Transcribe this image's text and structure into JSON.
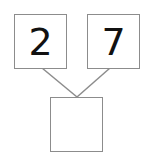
{
  "diagram": {
    "type": "number-bond",
    "parts": [
      {
        "id": "left",
        "value": "2"
      },
      {
        "id": "right",
        "value": "7"
      }
    ],
    "whole": {
      "value": ""
    },
    "colors": {
      "border": "#8c8c8c",
      "line": "#8c8c8c",
      "text": "#111111"
    }
  }
}
